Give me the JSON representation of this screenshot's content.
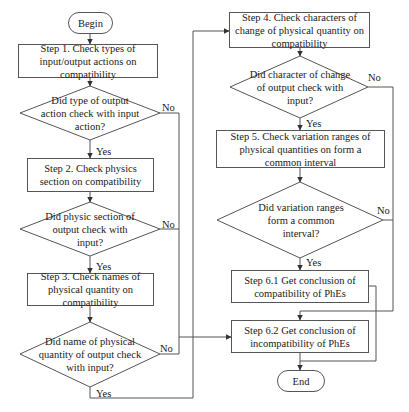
{
  "flowchart": {
    "start": "Begin",
    "end": "End",
    "steps": {
      "step1": "Step 1. Check types of input/output actions on compatibility",
      "step2": "Step 2. Check physics section on compatibility",
      "step3": "Step 3. Check names of physical quantity on compatibility",
      "step4": "Step 4. Check characters of change of physical quantity on compatibility",
      "step5": "Step 5. Check variation ranges of physical quantities on form a common interval",
      "step61": "Step 6.1 Get conclusion of compatibility of PhEs",
      "step62": "Step 6.2 Get conclusion of incompatibility of PhEs"
    },
    "decisions": {
      "d1": "Did type of output action check with input action?",
      "d2": "Did physic section of output check with input?",
      "d3": "Did name of physical quantity of output check with input?",
      "d4": "Did character of change of output check with input?",
      "d5": "Did variation ranges form a common interval?"
    },
    "labels": {
      "yes": "Yes",
      "no": "No"
    },
    "colors": {
      "line": "#555555",
      "text": "#1a1a1a",
      "background": "#ffffff"
    }
  }
}
